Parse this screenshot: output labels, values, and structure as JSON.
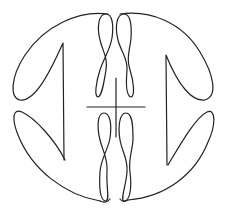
{
  "figure": {
    "background": "#ffffff",
    "stroke_color": "#222222",
    "stroke_width": 1.2
  }
}
